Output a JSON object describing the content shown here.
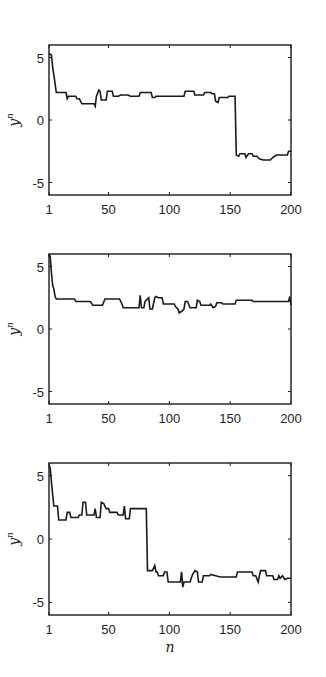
{
  "chart_data": [
    {
      "type": "line",
      "title": "",
      "xlabel": "",
      "ylabel": "y^n",
      "ylabel_base": "y",
      "ylabel_sup": "n",
      "xlim": [
        1,
        200
      ],
      "ylim": [
        -6,
        6
      ],
      "xticks": [
        1,
        50,
        100,
        150,
        200
      ],
      "xtick_labels": [
        "1",
        "50",
        "100",
        "150",
        "200"
      ],
      "yticks": [
        5,
        0,
        -5
      ],
      "ytick_labels": [
        "5",
        "0",
        "-5"
      ],
      "grid": false,
      "color": "#1a1a1a",
      "series": [
        {
          "name": "panel-1",
          "points": [
            [
              1,
              5.3
            ],
            [
              3,
              5.2
            ],
            [
              4,
              4.2
            ],
            [
              5,
              3.6
            ],
            [
              7,
              2.2
            ],
            [
              15,
              2.2
            ],
            [
              16,
              1.7
            ],
            [
              17,
              1.9
            ],
            [
              23,
              1.9
            ],
            [
              24,
              1.7
            ],
            [
              26,
              1.7
            ],
            [
              28,
              1.3
            ],
            [
              38,
              1.3
            ],
            [
              39,
              1.1
            ],
            [
              40,
              1.9
            ],
            [
              42,
              2.4
            ],
            [
              43,
              2.3
            ],
            [
              44,
              1.6
            ],
            [
              48,
              1.6
            ],
            [
              49,
              2.3
            ],
            [
              53,
              2.3
            ],
            [
              54,
              1.9
            ],
            [
              58,
              1.9
            ],
            [
              60,
              2.0
            ],
            [
              66,
              2.0
            ],
            [
              68,
              1.9
            ],
            [
              75,
              1.9
            ],
            [
              76,
              2.2
            ],
            [
              85,
              2.2
            ],
            [
              86,
              1.8
            ],
            [
              88,
              1.8
            ],
            [
              89,
              1.9
            ],
            [
              112,
              1.9
            ],
            [
              113,
              2.3
            ],
            [
              120,
              2.3
            ],
            [
              121,
              2.0
            ],
            [
              128,
              2.0
            ],
            [
              129,
              2.2
            ],
            [
              134,
              2.2
            ],
            [
              135,
              2.1
            ],
            [
              137,
              2.1
            ],
            [
              138,
              1.5
            ],
            [
              140,
              1.4
            ],
            [
              141,
              1.8
            ],
            [
              148,
              1.8
            ],
            [
              149,
              1.9
            ],
            [
              154,
              1.9
            ],
            [
              155,
              -2.8
            ],
            [
              157,
              -2.9
            ],
            [
              158,
              -2.7
            ],
            [
              162,
              -2.7
            ],
            [
              163,
              -3.0
            ],
            [
              165,
              -2.7
            ],
            [
              168,
              -2.7
            ],
            [
              169,
              -2.9
            ],
            [
              172,
              -2.9
            ],
            [
              174,
              -3.1
            ],
            [
              177,
              -3.2
            ],
            [
              183,
              -3.2
            ],
            [
              185,
              -3.0
            ],
            [
              188,
              -2.8
            ],
            [
              197,
              -2.8
            ],
            [
              198,
              -2.5
            ],
            [
              200,
              -2.5
            ]
          ]
        },
        {
          "name": "panel-2",
          "points": [
            [
              1,
              6.0
            ],
            [
              2,
              5.8
            ],
            [
              3,
              4.5
            ],
            [
              4,
              3.5
            ],
            [
              5,
              3.2
            ],
            [
              6,
              2.6
            ],
            [
              7,
              2.4
            ],
            [
              22,
              2.4
            ],
            [
              23,
              2.2
            ],
            [
              35,
              2.2
            ],
            [
              37,
              1.9
            ],
            [
              45,
              1.9
            ],
            [
              47,
              2.4
            ],
            [
              59,
              2.4
            ],
            [
              61,
              2.0
            ],
            [
              62,
              1.7
            ],
            [
              75,
              1.7
            ],
            [
              76,
              2.7
            ],
            [
              77,
              1.7
            ],
            [
              79,
              1.7
            ],
            [
              80,
              2.2
            ],
            [
              83,
              2.5
            ],
            [
              84,
              1.6
            ],
            [
              86,
              1.6
            ],
            [
              88,
              2.5
            ],
            [
              89,
              2.6
            ],
            [
              91,
              2.5
            ],
            [
              94,
              2.5
            ],
            [
              95,
              2.0
            ],
            [
              104,
              2.0
            ],
            [
              105,
              1.8
            ],
            [
              107,
              1.6
            ],
            [
              108,
              1.3
            ],
            [
              110,
              1.4
            ],
            [
              112,
              1.6
            ],
            [
              113,
              2.2
            ],
            [
              115,
              2.2
            ],
            [
              117,
              1.7
            ],
            [
              122,
              1.7
            ],
            [
              123,
              2.3
            ],
            [
              125,
              2.2
            ],
            [
              126,
              1.9
            ],
            [
              133,
              1.9
            ],
            [
              134,
              2.0
            ],
            [
              136,
              1.7
            ],
            [
              138,
              1.8
            ],
            [
              139,
              2.1
            ],
            [
              143,
              2.1
            ],
            [
              144,
              2.0
            ],
            [
              154,
              2.0
            ],
            [
              155,
              2.3
            ],
            [
              168,
              2.3
            ],
            [
              169,
              2.2
            ],
            [
              198,
              2.2
            ],
            [
              199,
              2.6
            ],
            [
              200,
              1.9
            ]
          ]
        },
        {
          "name": "panel-3",
          "points": [
            [
              1,
              5.8
            ],
            [
              2,
              5.6
            ],
            [
              3,
              4.5
            ],
            [
              4,
              3.5
            ],
            [
              5,
              2.6
            ],
            [
              8,
              2.6
            ],
            [
              9,
              1.5
            ],
            [
              15,
              1.5
            ],
            [
              16,
              2.1
            ],
            [
              18,
              2.1
            ],
            [
              19,
              1.7
            ],
            [
              25,
              1.7
            ],
            [
              26,
              1.9
            ],
            [
              28,
              1.9
            ],
            [
              29,
              2.9
            ],
            [
              31,
              2.9
            ],
            [
              32,
              1.9
            ],
            [
              38,
              1.9
            ],
            [
              39,
              2.4
            ],
            [
              40,
              1.7
            ],
            [
              43,
              1.7
            ],
            [
              44,
              2.9
            ],
            [
              46,
              2.8
            ],
            [
              48,
              2.4
            ],
            [
              50,
              2.4
            ],
            [
              51,
              2.1
            ],
            [
              57,
              2.1
            ],
            [
              58,
              1.9
            ],
            [
              62,
              1.9
            ],
            [
              63,
              2.6
            ],
            [
              64,
              1.6
            ],
            [
              67,
              1.6
            ],
            [
              68,
              2.4
            ],
            [
              81,
              2.4
            ],
            [
              82,
              -2.5
            ],
            [
              86,
              -2.5
            ],
            [
              88,
              -2.1
            ],
            [
              89,
              -2.6
            ],
            [
              90,
              -2.6
            ],
            [
              91,
              -2.9
            ],
            [
              95,
              -2.9
            ],
            [
              96,
              -2.6
            ],
            [
              98,
              -2.6
            ],
            [
              99,
              -3.4
            ],
            [
              109,
              -3.4
            ],
            [
              110,
              -2.6
            ],
            [
              111,
              -3.8
            ],
            [
              112,
              -3.4
            ],
            [
              117,
              -3.4
            ],
            [
              119,
              -2.8
            ],
            [
              121,
              -2.5
            ],
            [
              123,
              -2.6
            ],
            [
              124,
              -3.4
            ],
            [
              127,
              -3.4
            ],
            [
              128,
              -2.9
            ],
            [
              133,
              -2.9
            ],
            [
              134,
              -2.8
            ],
            [
              138,
              -2.9
            ],
            [
              142,
              -3.0
            ],
            [
              155,
              -3.0
            ],
            [
              156,
              -2.6
            ],
            [
              168,
              -2.6
            ],
            [
              169,
              -2.9
            ],
            [
              171,
              -2.9
            ],
            [
              173,
              -3.4
            ],
            [
              174,
              -2.9
            ],
            [
              175,
              -2.5
            ],
            [
              179,
              -2.5
            ],
            [
              180,
              -2.9
            ],
            [
              185,
              -2.9
            ],
            [
              186,
              -3.2
            ],
            [
              189,
              -3.2
            ],
            [
              190,
              -2.9
            ],
            [
              191,
              -3.1
            ],
            [
              193,
              -2.9
            ],
            [
              195,
              -3.2
            ],
            [
              197,
              -3.1
            ],
            [
              200,
              -3.1
            ]
          ]
        }
      ],
      "shared_xlabel": "n"
    }
  ]
}
